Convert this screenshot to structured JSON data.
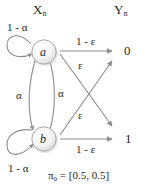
{
  "diagram": {
    "title_left": "X",
    "title_left_sub": "n",
    "title_right": "Y",
    "title_right_sub": "n",
    "colors": {
      "stroke": "#8c8c8c",
      "text": "#231f20",
      "node_fill": "#f2f2f2",
      "background": "#ffffff"
    },
    "states": [
      {
        "id": "a",
        "label": "a"
      },
      {
        "id": "b",
        "label": "b"
      }
    ],
    "observations": [
      {
        "id": "0",
        "label": "0"
      },
      {
        "id": "1",
        "label": "1"
      }
    ],
    "transition_labels": {
      "self_loop_a": "1 - α",
      "self_loop_b": "1 - α",
      "a_to_b": "α",
      "b_to_a": "α"
    },
    "emission_labels": {
      "a_to_0": "1 - ε",
      "a_to_1": "ε",
      "b_to_0": "ε",
      "b_to_1": "1 - ε"
    },
    "initial_distribution": {
      "symbol": "π",
      "subscript": "0",
      "equals": "= [0.5, 0.5]",
      "full": "π₀ = [0.5, 0.5]"
    }
  }
}
